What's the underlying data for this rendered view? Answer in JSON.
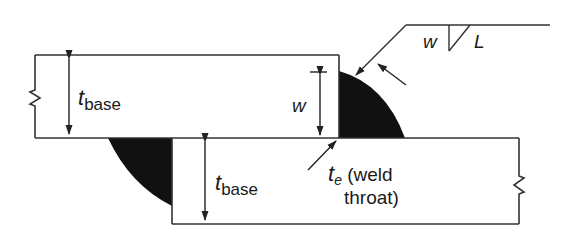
{
  "diagram": {
    "type": "fillet-weld lap joint cross-section",
    "colors": {
      "line": "#333333",
      "weld_fill": "#111111",
      "background": "#ffffff",
      "text": "#1a1a1a"
    },
    "labels": {
      "t_base_top": {
        "symbol": "t",
        "subscript": "base"
      },
      "t_base_bottom": {
        "symbol": "t",
        "subscript": "base"
      },
      "weld_size": "w",
      "weld_size_bar": "w",
      "throat": {
        "symbol": "t",
        "subscript": "e",
        "text_line1": " (weld",
        "text_line2": "throat)"
      },
      "weld_symbol": {
        "size": "w",
        "length": "L"
      }
    },
    "components": [
      "top-base-plate",
      "bottom-base-plate",
      "upper-fillet-weld",
      "lower-fillet-weld",
      "weld-symbol-leader",
      "break-marks"
    ]
  }
}
